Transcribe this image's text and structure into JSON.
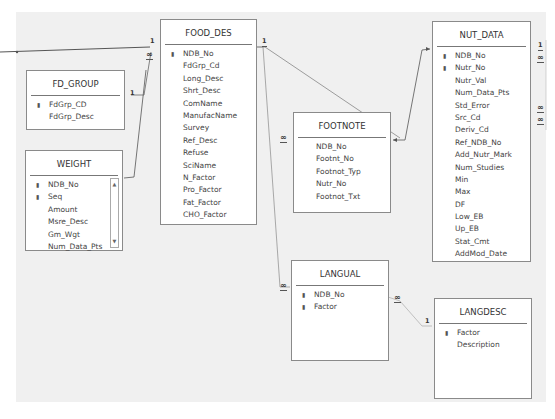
{
  "diagram": {
    "tables": {
      "food_des": {
        "name": "FOOD_DES",
        "fields": [
          {
            "name": "NDB_No",
            "key": true
          },
          {
            "name": "FdGrp_Cd",
            "key": false
          },
          {
            "name": "Long_Desc",
            "key": false
          },
          {
            "name": "Shrt_Desc",
            "key": false
          },
          {
            "name": "ComName",
            "key": false
          },
          {
            "name": "ManufacName",
            "key": false
          },
          {
            "name": "Survey",
            "key": false
          },
          {
            "name": "Ref_Desc",
            "key": false
          },
          {
            "name": "Refuse",
            "key": false
          },
          {
            "name": "SciName",
            "key": false
          },
          {
            "name": "N_Factor",
            "key": false
          },
          {
            "name": "Pro_Factor",
            "key": false
          },
          {
            "name": "Fat_Factor",
            "key": false
          },
          {
            "name": "CHO_Factor",
            "key": false
          }
        ]
      },
      "fd_group": {
        "name": "FD_GROUP",
        "fields": [
          {
            "name": "FdGrp_CD",
            "key": true
          },
          {
            "name": "FdGrp_Desc",
            "key": false
          }
        ]
      },
      "weight": {
        "name": "WEIGHT",
        "fields": [
          {
            "name": "NDB_No",
            "key": true
          },
          {
            "name": "Seq",
            "key": true
          },
          {
            "name": "Amount",
            "key": false
          },
          {
            "name": "Msre_Desc",
            "key": false
          },
          {
            "name": "Gm_Wgt",
            "key": false
          },
          {
            "name": "Num_Data_Pts",
            "key": false
          }
        ]
      },
      "footnote": {
        "name": "FOOTNOTE",
        "fields": [
          {
            "name": "NDB_No",
            "key": false
          },
          {
            "name": "Footnt_No",
            "key": false
          },
          {
            "name": "Footnot_Typ",
            "key": false
          },
          {
            "name": "Nutr_No",
            "key": false
          },
          {
            "name": "Footnot_Txt",
            "key": false
          }
        ]
      },
      "nut_data": {
        "name": "NUT_DATA",
        "fields": [
          {
            "name": "NDB_No",
            "key": true
          },
          {
            "name": "Nutr_No",
            "key": true
          },
          {
            "name": "Nutr_Val",
            "key": false
          },
          {
            "name": "Num_Data_Pts",
            "key": false
          },
          {
            "name": "Std_Error",
            "key": false
          },
          {
            "name": "Src_Cd",
            "key": false
          },
          {
            "name": "Deriv_Cd",
            "key": false
          },
          {
            "name": "Ref_NDB_No",
            "key": false
          },
          {
            "name": "Add_Nutr_Mark",
            "key": false
          },
          {
            "name": "Num_Studies",
            "key": false
          },
          {
            "name": "Min",
            "key": false
          },
          {
            "name": "Max",
            "key": false
          },
          {
            "name": "DF",
            "key": false
          },
          {
            "name": "Low_EB",
            "key": false
          },
          {
            "name": "Up_EB",
            "key": false
          },
          {
            "name": "Stat_Cmt",
            "key": false
          },
          {
            "name": "AddMod_Date",
            "key": false
          }
        ]
      },
      "langual": {
        "name": "LANGUAL",
        "fields": [
          {
            "name": "NDB_No",
            "key": true
          },
          {
            "name": "Factor",
            "key": true
          }
        ]
      },
      "langdesc": {
        "name": "LANGDESC",
        "fields": [
          {
            "name": "Factor",
            "key": true
          },
          {
            "name": "Description",
            "key": false
          }
        ]
      }
    },
    "cardinality": {
      "one": "1",
      "many": "∞"
    },
    "icons": {
      "key": "primary-key-icon",
      "scroll_up": "▲",
      "scroll_down": "▼"
    },
    "colors": {
      "background": "#f0f0f0",
      "table_bg": "#ffffff",
      "border": "#8a8a8a",
      "line": "#555555"
    }
  }
}
